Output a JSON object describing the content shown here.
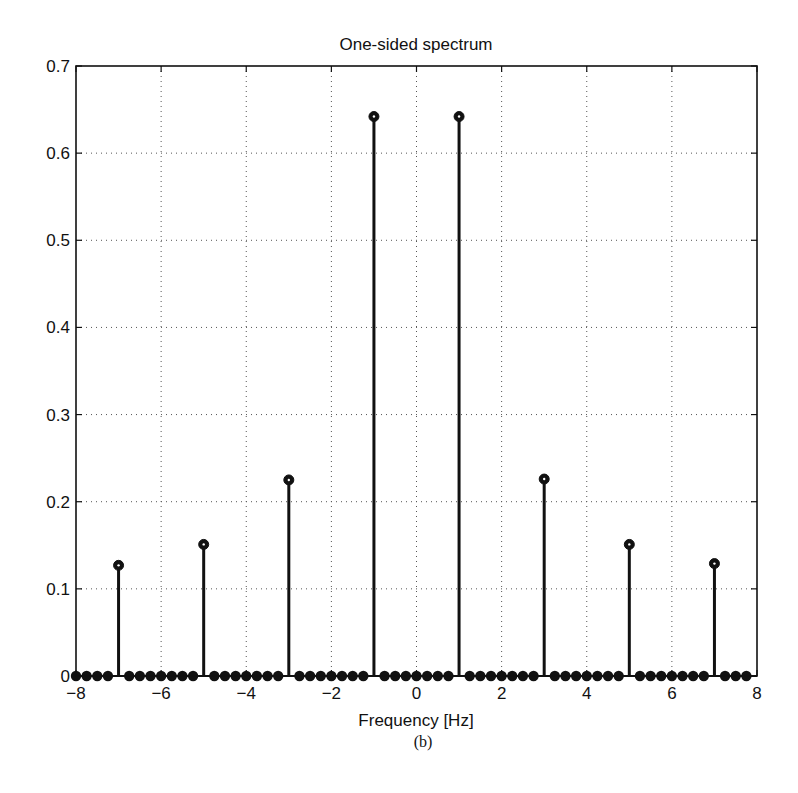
{
  "figure": {
    "title": "One-sided spectrum",
    "xlabel": "Frequency [Hz]",
    "caption": "(b)"
  },
  "axes": {
    "x_ticks": [
      {
        "value": -8,
        "label": "−8"
      },
      {
        "value": -6,
        "label": "−6"
      },
      {
        "value": -4,
        "label": "−4"
      },
      {
        "value": -2,
        "label": "−2"
      },
      {
        "value": 0,
        "label": "0"
      },
      {
        "value": 2,
        "label": "2"
      },
      {
        "value": 4,
        "label": "4"
      },
      {
        "value": 6,
        "label": "6"
      },
      {
        "value": 8,
        "label": "8"
      }
    ],
    "y_ticks": [
      {
        "value": 0,
        "label": "0"
      },
      {
        "value": 0.1,
        "label": "0.1"
      },
      {
        "value": 0.2,
        "label": "0.2"
      },
      {
        "value": 0.3,
        "label": "0.3"
      },
      {
        "value": 0.4,
        "label": "0.4"
      },
      {
        "value": 0.5,
        "label": "0.5"
      },
      {
        "value": 0.6,
        "label": "0.6"
      },
      {
        "value": 0.7,
        "label": "0.7"
      }
    ]
  },
  "chart_data": {
    "type": "stem",
    "title": "One-sided spectrum",
    "xlabel": "Frequency [Hz]",
    "ylabel": "",
    "caption": "(b)",
    "xlim": [
      -8,
      8
    ],
    "ylim": [
      0,
      0.7
    ],
    "grid": true,
    "legend": null,
    "sample_spacing_hz": 0.25,
    "x_start": -8,
    "x_end": 7.75,
    "nonzero_points": [
      {
        "x": -7,
        "y": 0.127
      },
      {
        "x": -5,
        "y": 0.151
      },
      {
        "x": -3,
        "y": 0.225
      },
      {
        "x": -1,
        "y": 0.642
      },
      {
        "x": 1,
        "y": 0.642
      },
      {
        "x": 3,
        "y": 0.226
      },
      {
        "x": 5,
        "y": 0.151
      },
      {
        "x": 7,
        "y": 0.129
      }
    ],
    "series": [
      {
        "name": "spectrum",
        "x": [
          -8,
          -7.75,
          -7.5,
          -7.25,
          -7,
          -6.75,
          -6.5,
          -6.25,
          -6,
          -5.75,
          -5.5,
          -5.25,
          -5,
          -4.75,
          -4.5,
          -4.25,
          -4,
          -3.75,
          -3.5,
          -3.25,
          -3,
          -2.75,
          -2.5,
          -2.25,
          -2,
          -1.75,
          -1.5,
          -1.25,
          -1,
          -0.75,
          -0.5,
          -0.25,
          0,
          0.25,
          0.5,
          0.75,
          1,
          1.25,
          1.5,
          1.75,
          2,
          2.25,
          2.5,
          2.75,
          3,
          3.25,
          3.5,
          3.75,
          4,
          4.25,
          4.5,
          4.75,
          5,
          5.25,
          5.5,
          5.75,
          6,
          6.25,
          6.5,
          6.75,
          7,
          7.25,
          7.5,
          7.75
        ],
        "values": [
          0,
          0,
          0,
          0,
          0.127,
          0,
          0,
          0,
          0,
          0,
          0,
          0,
          0.151,
          0,
          0,
          0,
          0,
          0,
          0,
          0,
          0.225,
          0,
          0,
          0,
          0,
          0,
          0,
          0,
          0.642,
          0,
          0,
          0,
          0,
          0,
          0,
          0,
          0.642,
          0,
          0,
          0,
          0,
          0,
          0,
          0,
          0.226,
          0,
          0,
          0,
          0,
          0,
          0,
          0,
          0.151,
          0,
          0,
          0,
          0,
          0,
          0,
          0,
          0.129,
          0,
          0,
          0
        ]
      }
    ]
  }
}
